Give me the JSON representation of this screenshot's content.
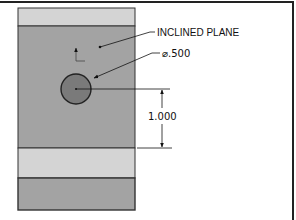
{
  "drawing": {
    "title": "Inclined plane hole detail",
    "colors": {
      "frame": "#222222",
      "face_dark": "#a3a3a3",
      "face_light": "#d4d4d4",
      "hole_fill": "#7a7a7a",
      "outline": "#333333",
      "annotation": "#111111"
    },
    "annotations": {
      "plane_label": "INCLINED PLANE",
      "hole_diameter": "⌀.500",
      "vertical_dimension": "1.000"
    },
    "features": {
      "hole": {
        "shape": "circle",
        "diameter": 0.5
      },
      "dimension_from_hole_center_to_edge": 1.0
    }
  }
}
